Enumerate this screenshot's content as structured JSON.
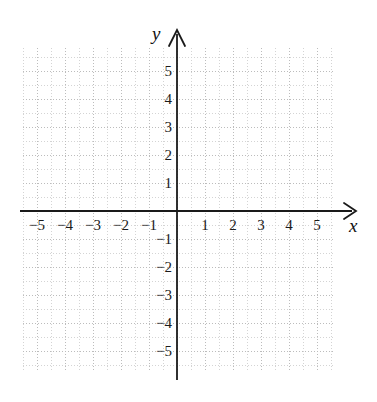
{
  "figure": {
    "kind": "cartesian-coordinate-grid",
    "background_color": "#ffffff",
    "grid_color": "#c8c8c8",
    "grid_major_color": "#bdbdbd",
    "axis_color": "#1a1a1a"
  },
  "chart_data": {
    "type": "scatter",
    "title": "",
    "subtitle": "",
    "xlabel": "x",
    "ylabel": "y",
    "xlim": [
      -5.6,
      5.6
    ],
    "ylim": [
      -5.75,
      5.75
    ],
    "grid": true,
    "grid_major_step": 1,
    "grid_minor_step": 0.5,
    "legend": null,
    "legend_position": "none",
    "annotations": [],
    "series": [],
    "x_ticks": [
      -5,
      -4,
      -3,
      -2,
      -1,
      1,
      2,
      3,
      4,
      5
    ],
    "y_ticks": [
      5,
      4,
      3,
      2,
      1,
      -1,
      -2,
      -3,
      -4,
      -5
    ],
    "x_tick_labels": [
      "−5",
      "−4",
      "−3",
      "−2",
      "−1",
      "1",
      "2",
      "3",
      "4",
      "5"
    ],
    "y_tick_labels": [
      "5",
      "4",
      "3",
      "2",
      "1",
      "−1",
      "−2",
      "−3",
      "−4",
      "−5"
    ]
  },
  "axis_names": {
    "x": "x",
    "y": "y"
  },
  "arrows": {
    "x_arrow": "arrow-right-icon",
    "y_arrow": "arrow-up-icon"
  }
}
